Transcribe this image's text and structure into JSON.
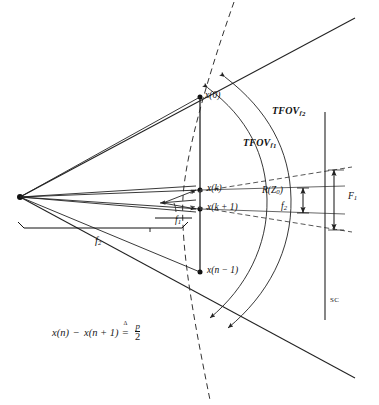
{
  "figure": {
    "kind": "optical-scanner-geometry-diagram",
    "background": "#ffffff",
    "line_color": "#222222",
    "labels": {
      "x0": "x(0)",
      "xk": "x(k)",
      "xk1": "x(k + 1)",
      "xn1": "x(n − 1)",
      "tfov_f2_text": "TFOV",
      "tfov_f2_sub": "f",
      "tfov_f2_sub2": "2",
      "tfov_f1_text": "TFOV",
      "tfov_f1_sub": "f",
      "tfov_f1_sub2": "1",
      "f1": "f",
      "f1_sub": "1",
      "f2": "f",
      "f2_sub": "2",
      "f2_right": "f",
      "f2_right_sub": "2",
      "rz0": "R(Z",
      "rz0_sub": "0",
      "rz0_close": ")",
      "F1": "F",
      "F1_sub": "1",
      "sc": "SC"
    },
    "formula": {
      "lhs_a": "x(n)",
      "minus": "−",
      "lhs_b": "x(n + 1)",
      "relation_symbol": "=",
      "relation_mark": "Δ",
      "numerator": "p",
      "denominator": "2"
    }
  },
  "geometry": {
    "apex": {
      "x": 20,
      "y": 197
    },
    "focal_line": {
      "x": 200,
      "y_top": 96,
      "y_bottom": 273
    },
    "sc_line": {
      "x": 325,
      "y_top": 112,
      "y_bottom": 320
    },
    "points": [
      {
        "name": "x(0)",
        "x": 200,
        "y": 97
      },
      {
        "name": "x(k)",
        "x": 200,
        "y": 190
      },
      {
        "name": "x(k + 1)",
        "x": 200,
        "y": 209
      },
      {
        "name": "x(n - 1)",
        "x": 200,
        "y": 272
      }
    ]
  }
}
